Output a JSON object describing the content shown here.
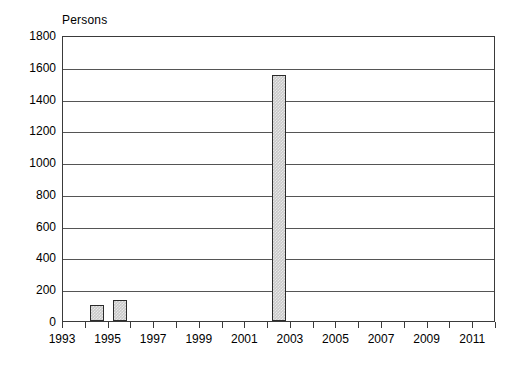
{
  "chart_data": {
    "type": "bar",
    "title": "",
    "subtitle": "",
    "xlabel": "",
    "ylabel": "Persons",
    "unit_caption": "Persons",
    "categories": [
      1993,
      1994,
      1995,
      1996,
      1997,
      1998,
      1999,
      2000,
      2001,
      2002,
      2003,
      2004,
      2005,
      2006,
      2007,
      2008,
      2009,
      2010,
      2011,
      2012
    ],
    "values": [
      0,
      100,
      135,
      0,
      0,
      0,
      0,
      0,
      0,
      1550,
      0,
      0,
      0,
      0,
      0,
      0,
      0,
      0,
      0,
      0
    ],
    "series": [
      {
        "name": "Persons",
        "values": [
          0,
          100,
          135,
          0,
          0,
          0,
          0,
          0,
          0,
          1550,
          0,
          0,
          0,
          0,
          0,
          0,
          0,
          0,
          0,
          0
        ]
      }
    ],
    "ylim": [
      0,
      1800
    ],
    "xlim": [
      1993,
      2012
    ],
    "ytick_values": [
      0,
      200,
      400,
      600,
      800,
      1000,
      1200,
      1400,
      1600,
      1800
    ],
    "ytick_labels": [
      "0",
      "200",
      "400",
      "600",
      "800",
      "1000",
      "1200",
      "1400",
      "1600",
      "1800"
    ],
    "xtick_values": [
      1993,
      1994,
      1995,
      1996,
      1997,
      1998,
      1999,
      2000,
      2001,
      2002,
      2003,
      2004,
      2005,
      2006,
      2007,
      2008,
      2009,
      2010,
      2011,
      2012
    ],
    "xtick_labels_shown": [
      "1993",
      "1995",
      "1997",
      "1999",
      "2001",
      "2003",
      "2005",
      "2007",
      "2009",
      "2011"
    ],
    "xtick_label_values": [
      1993,
      1995,
      1997,
      1999,
      2001,
      2003,
      2005,
      2007,
      2009,
      2011
    ],
    "grid": "horizontal",
    "legend": "none",
    "bar_fill_color": "#c9c9c9",
    "bar_border_color": "#2b2b2b",
    "axis_color": "#3a3a3a",
    "gridline_color": "#555555",
    "background_color": "#ffffff"
  }
}
